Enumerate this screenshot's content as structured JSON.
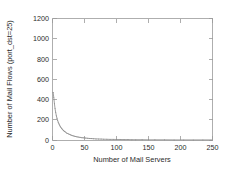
{
  "chart_data": {
    "type": "line",
    "title": "",
    "xlabel": "Number of Mail Servers",
    "ylabel": "Number of Mail Flows (port_dst=25)",
    "xlim": [
      0,
      250
    ],
    "ylim": [
      0,
      1200
    ],
    "xticks": [
      0,
      50,
      100,
      150,
      200,
      250
    ],
    "yticks": [
      0,
      200,
      400,
      600,
      800,
      1000,
      1200
    ],
    "xtick_labels": [
      "0",
      "50",
      "100",
      "150",
      "200",
      "250"
    ],
    "ytick_labels": [
      "0",
      "200",
      "400",
      "600",
      "800",
      "1000",
      "1200"
    ],
    "grid": false,
    "legend": null,
    "legend_position": "none",
    "series": [
      {
        "name": "mail flows",
        "color": "#8e8e8e",
        "x": [
          1,
          2,
          3,
          4,
          5,
          6,
          7,
          8,
          9,
          10,
          11,
          12,
          13,
          14,
          15,
          16,
          17,
          18,
          19,
          20,
          22,
          24,
          26,
          28,
          30,
          32,
          34,
          36,
          38,
          40,
          43,
          46,
          49,
          52,
          55,
          58,
          61,
          64,
          68,
          72,
          76,
          80,
          85,
          90,
          95,
          100,
          106,
          112,
          118,
          124,
          130,
          140,
          150,
          160,
          175,
          190,
          205,
          220,
          235,
          248
        ],
        "values": [
          470,
          420,
          360,
          310,
          272,
          240,
          215,
          193,
          175,
          160,
          147,
          136,
          126,
          117,
          109,
          102,
          95,
          89,
          84,
          79,
          70,
          63,
          57,
          51,
          46,
          42,
          38,
          35,
          32,
          29,
          26,
          23,
          21,
          19,
          17,
          15,
          14,
          13,
          11,
          10,
          9,
          8,
          7,
          6,
          6,
          5,
          5,
          4,
          4,
          3,
          3,
          3,
          2,
          2,
          2,
          1,
          1,
          1,
          1,
          1
        ]
      }
    ]
  }
}
